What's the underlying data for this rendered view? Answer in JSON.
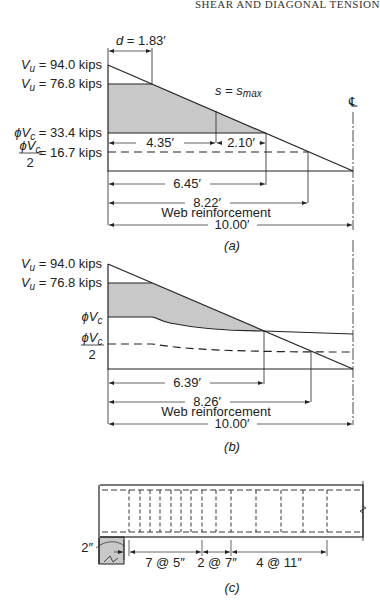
{
  "header": {
    "running_title": "SHEAR AND DIAGONAL TENSION"
  },
  "diagram_a": {
    "caption": "(a)",
    "d_label": "d = 1.83′",
    "vu_max_label": "V",
    "vu_max_sub": "u",
    "vu_max_value": " = 94.0 kips",
    "vu_crit_label": "V",
    "vu_crit_sub": "u",
    "vu_crit_value": " = 76.8 kips",
    "phivc_label": "ϕV",
    "phivc_sub": "c",
    "phivc_value": " = 33.4 kips",
    "phivc_half_num": "ϕV",
    "phivc_half_sub": "c",
    "phivc_half_den": "2",
    "phivc_half_value": "= 16.7 kips",
    "smax_label": "s = s",
    "smax_sub": "max",
    "centerline_symbol": "℄",
    "dim_435": "4.35′",
    "dim_210": "2.10′",
    "dim_645": "6.45′",
    "dim_822": "8.22′",
    "web_label": "Web reinforcement",
    "dim_1000": "10.00′"
  },
  "diagram_b": {
    "caption": "(b)",
    "vu_max_label": "V",
    "vu_max_sub": "u",
    "vu_max_value": " = 94.0 kips",
    "vu_crit_label": "V",
    "vu_crit_sub": "u",
    "vu_crit_value": " = 76.8 kips",
    "phivc_label": "ϕV",
    "phivc_sub": "c",
    "phivc_half_num": "ϕV",
    "phivc_half_sub": "c",
    "phivc_half_den": "2",
    "dim_639": "6.39′",
    "dim_826": "8.26′",
    "web_label": "Web reinforcement",
    "dim_1000": "10.00′"
  },
  "diagram_c": {
    "caption": "(c)",
    "support_offset": "2″",
    "spacing_1": "7 @ 5″",
    "spacing_2": "2 @ 7″",
    "spacing_3": "4 @ 11″"
  },
  "colors": {
    "shade": "#c8c8c8",
    "line": "#222222"
  }
}
